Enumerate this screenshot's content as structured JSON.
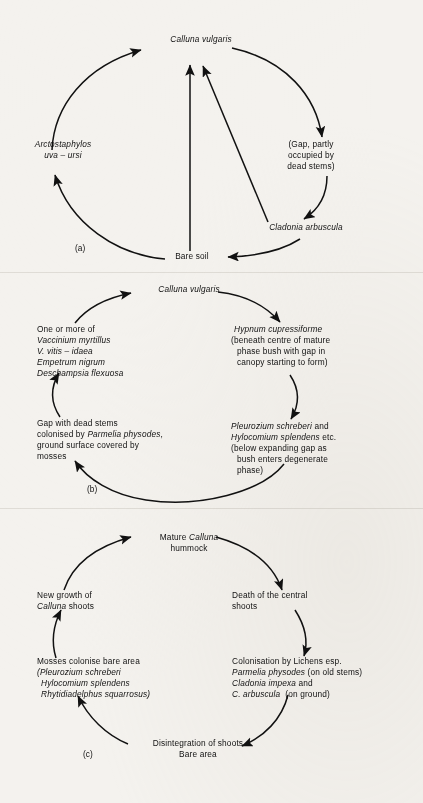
{
  "figure": {
    "type": "cyclic-succession-diagrams",
    "panel_count": 3
  },
  "panel_a": {
    "tag": "(a)",
    "nodes": {
      "top": "Calluna vulgaris",
      "left": "Arctostaphylos",
      "left2": "uva – ursi",
      "right_line1": "(Gap, partly",
      "right_line2": "occupied by",
      "right_line3": "dead stems)",
      "lower_right": "Cladonia arbuscula",
      "bottom": "Bare soil"
    }
  },
  "panel_b": {
    "tag": "(b)",
    "nodes": {
      "top": "Calluna vulgaris",
      "left_top_line1": "One or more of",
      "left_top_line2": "Vaccinium myrtillus",
      "left_top_line3": "V. vitis – idaea",
      "left_top_line4": "Empetrum nigrum",
      "left_top_line5": "Deschampsia flexuosa",
      "left_bot_line1": "Gap with dead stems",
      "left_bot_line2": "colonised by Parmelia physodes,",
      "left_bot_line3": "ground surface covered by",
      "left_bot_line4": "mosses",
      "right_top_line1": "Hypnum cupressiforme",
      "right_top_line2": "(beneath centre of mature",
      "right_top_line3": "phase bush with gap in",
      "right_top_line4": "canopy starting to form)",
      "right_bot_line1": "Pleurozium schreberi and",
      "right_bot_line2": "Hylocomium splendens etc.",
      "right_bot_line3": "(below expanding gap as",
      "right_bot_line4": "bush enters degenerate",
      "right_bot_line5": "phase)"
    }
  },
  "panel_c": {
    "tag": "(c)",
    "nodes": {
      "top_line1_a": "Mature ",
      "top_line1_b": "Calluna",
      "top_line2": "hummock",
      "left_top_line1": "New growth of",
      "left_top_line2_a": "Calluna",
      "left_top_line2_b": " shoots",
      "right_top_line1": "Death of the central",
      "right_top_line2": "shoots",
      "left_bot_line1": "Mosses colonise bare area",
      "left_bot_line2": "(Pleurozium schreberi",
      "left_bot_line3": "Hylocomium splendens",
      "left_bot_line4": "Rhytidiadelphus squarrosus)",
      "right_bot_line1": "Colonisation by Lichens esp.",
      "right_bot_line2_a": "Parmelia physodes",
      "right_bot_line2_b": " (on old stems)",
      "right_bot_line3_a": "Cladonia impexa",
      "right_bot_line3_b": " and",
      "right_bot_line4_a": "C. arbuscula",
      "right_bot_line4_b": "  (on ground)",
      "bottom_line1": "Disintegration of shoots",
      "bottom_line2": "Bare area"
    }
  },
  "style": {
    "ink": "#111111",
    "paper": "#f4f2ee"
  }
}
